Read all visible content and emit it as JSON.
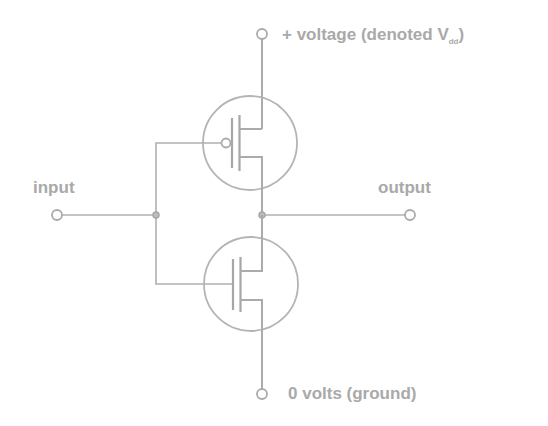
{
  "diagram": {
    "labels": {
      "vdd_prefix": "+ voltage  (denoted V",
      "vdd_subscript": "dd",
      "vdd_suffix": ")",
      "input": "input",
      "output": "output",
      "ground": "0 volts (ground)"
    },
    "components": [
      {
        "name": "PMOS transistor",
        "type": "p-channel MOSFET",
        "position": "top",
        "gate_bubble": true
      },
      {
        "name": "NMOS transistor",
        "type": "n-channel MOSFET",
        "position": "bottom",
        "gate_bubble": false
      }
    ],
    "terminals": [
      "Vdd",
      "input",
      "output",
      "ground"
    ],
    "colors": {
      "line": "#ababab",
      "text": "#a9a9a9",
      "background": "#ffffff"
    }
  }
}
